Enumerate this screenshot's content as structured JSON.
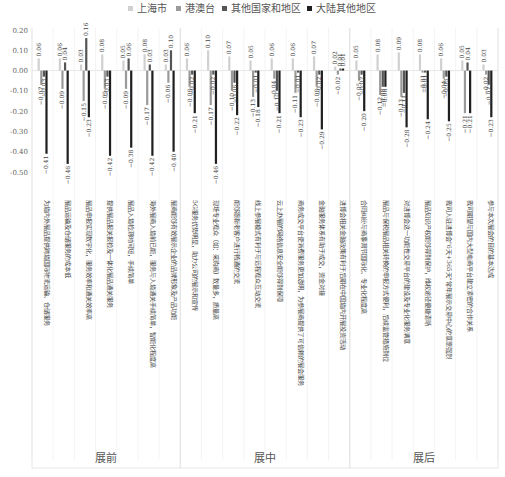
{
  "chart_data": {
    "type": "bar",
    "title": "",
    "xlabel": "",
    "ylabel": "",
    "ylim": [
      -0.5,
      0.2
    ],
    "yticks": [
      "0.20",
      "0.10",
      "0.00",
      "-0.10",
      "-0.20",
      "-0.30",
      "-0.40",
      "-0.50"
    ],
    "ytick_values": [
      0.2,
      0.1,
      0.0,
      -0.1,
      -0.2,
      -0.3,
      -0.4,
      -0.5
    ],
    "grid": "vertical separators",
    "legend_position": "top-center",
    "groups": [
      {
        "label": "展前",
        "count": 7
      },
      {
        "label": "展中",
        "count": 8
      },
      {
        "label": "展后",
        "count": 7
      }
    ],
    "categories": [
      "为境内外展品提供跨境国际物流运输、仓储服务",
      "展品运输及仓储服务的成本低",
      "展品申报实现数字化，服务效率和通关效率高",
      "提供展品报关报检及一体化展品通关服务",
      "展品入境检测时间短，手续简单",
      "海外展商入境前已能，服务与入境通关手续简单，智能化程度高",
      "展商能够有效展示企业的品牌形象及产品功能",
      "5G服务优势明显，助力公司的展示和宣传",
      "现场专业观众（如：采购商）数量多，质量高",
      "能够跟新老客户进行畅通的交流",
      "线上参展模式有利于与远程观众互动交流",
      "云上办展的网络信息安全能够得到保障",
      "商务成交平台使消费服务更加透明，为参展商提供了可信赖的展会服务",
      "金融服务体系有助于成交，资金对接",
      "进博会相关金融政策有利于后期在中国境内开展投资活动",
      "合同纠纷与商事调节国际化、专业化程度高",
      "展品与保税展品相关转换的申报方式便利，后续监管措施到位",
      "对进博会这一功能性交易平台的建设及专业化服务满意",
      "展品知识产权能够得到保护，维权途径便捷清晰",
      "我司入驻进博会\"6天+365天\"常年展示交易中心的意愿强烈",
      "我司期望与国内大型电商平台建立紧密的合作关系",
      "参与本次展会的目的基本达成"
    ],
    "series": [
      {
        "name": "上海市",
        "color": "#d0d0d0",
        "values": [
          0.06,
          0.06,
          0.03,
          0.08,
          0.05,
          0.08,
          0.03,
          0.06,
          0.1,
          0.07,
          0.05,
          0.06,
          0.06,
          0.07,
          0.02,
          0.05,
          0.08,
          0.09,
          0.08,
          0.06,
          0.05,
          0.03
        ]
      },
      {
        "name": "港澳台",
        "color": "#9a9a9a",
        "values": [
          -0.07,
          -0.09,
          -0.15,
          -0.09,
          -0.09,
          -0.17,
          -0.06,
          -0.08,
          -0.17,
          -0.1,
          -0.13,
          -0.04,
          -0.11,
          -0.08,
          -0.02,
          -0.05,
          -0.12,
          -0.13,
          -0.01,
          -0.04,
          -0.21,
          -0.02
        ]
      },
      {
        "name": "其他国家和地区",
        "color": "#555555",
        "values": [
          -0.03,
          0.04,
          0.16,
          -0.03,
          0.06,
          0.03,
          0.1,
          -0.02,
          -0.02,
          -0.06,
          -0.01,
          -0.1,
          -0.01,
          -0.02,
          0.01,
          -0.02,
          -0.08,
          -0.11,
          -0.01,
          -0.03,
          0.04,
          -0.07
        ]
      },
      {
        "name": "大陆其他地区",
        "color": "#1f1f1f",
        "values": [
          -0.41,
          -0.46,
          -0.23,
          -0.42,
          -0.38,
          -0.42,
          -0.4,
          -0.21,
          -0.46,
          -0.22,
          -0.18,
          -0.21,
          -0.23,
          -0.29,
          0.01,
          -0.2,
          -0.08,
          -0.28,
          -0.24,
          -0.25,
          -0.21,
          -0.23
        ]
      }
    ]
  }
}
